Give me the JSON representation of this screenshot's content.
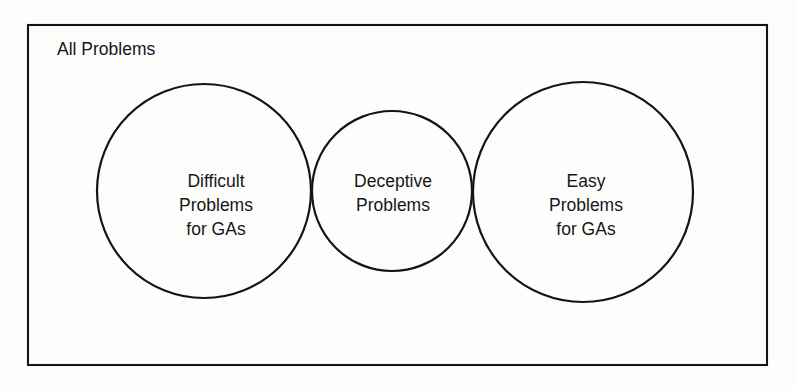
{
  "figure": {
    "type": "venn-diagram",
    "universe": {
      "label": "All Problems",
      "shape": "rectangle"
    },
    "sets": [
      {
        "id": "difficult",
        "lines": [
          "Difficult",
          "Problems",
          "for GAs"
        ],
        "line1": "Difficult",
        "line2": "Problems",
        "line3": "for GAs",
        "position": "left"
      },
      {
        "id": "deceptive",
        "lines": [
          "Deceptive",
          "Problems"
        ],
        "line1": "Deceptive",
        "line2": "Problems",
        "line3": "",
        "position": "center"
      },
      {
        "id": "easy",
        "lines": [
          "Easy",
          "Problems",
          "for GAs"
        ],
        "line1": "Easy",
        "line2": "Problems",
        "line3": "for GAs",
        "position": "right"
      }
    ],
    "colors": {
      "stroke": "#141417",
      "background": "#fdfdfc",
      "text": "#16161a"
    }
  }
}
